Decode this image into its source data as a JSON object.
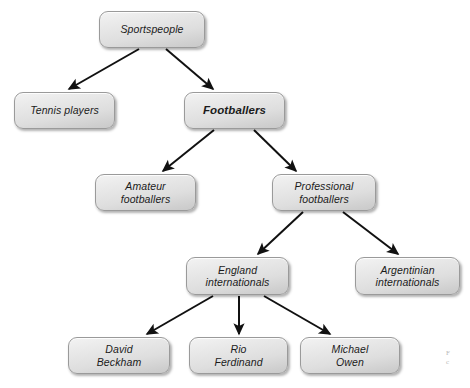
{
  "diagram": {
    "type": "hierarchy-tree",
    "background_color": "#ffffff",
    "node_fill_top": "#f3f3f3",
    "node_fill_bottom": "#c9c9c9",
    "node_border_color": "#9a9a9a",
    "edge_color": "#111111",
    "nodes": [
      {
        "id": "sportspeople",
        "label": "Sportspeople",
        "level": 0,
        "emphasis": false,
        "x": 99,
        "y": 11,
        "w": 106,
        "h": 37
      },
      {
        "id": "tennis-players",
        "label": "Tennis players",
        "level": 1,
        "emphasis": false,
        "x": 14,
        "y": 92,
        "w": 101,
        "h": 37
      },
      {
        "id": "footballers",
        "label": "Footballers",
        "level": 1,
        "emphasis": true,
        "x": 184,
        "y": 92,
        "w": 101,
        "h": 37
      },
      {
        "id": "amateur-footballers",
        "label": "Amateur\nfootballers",
        "level": 2,
        "emphasis": false,
        "x": 95,
        "y": 174,
        "w": 101,
        "h": 37
      },
      {
        "id": "professional-footballers",
        "label": "Professional\nfootballers",
        "level": 2,
        "emphasis": false,
        "x": 272,
        "y": 174,
        "w": 104,
        "h": 37
      },
      {
        "id": "england-internationals",
        "label": "England\ninternationals",
        "level": 3,
        "emphasis": false,
        "x": 186,
        "y": 257,
        "w": 103,
        "h": 38
      },
      {
        "id": "argentinian-internationals",
        "label": "Argentinian\ninternationals",
        "level": 3,
        "emphasis": false,
        "x": 355,
        "y": 257,
        "w": 105,
        "h": 38
      },
      {
        "id": "david-beckham",
        "label": "David\nBeckham",
        "level": 4,
        "emphasis": false,
        "x": 68,
        "y": 337,
        "w": 102,
        "h": 37
      },
      {
        "id": "rio-ferdinand",
        "label": "Rio\nFerdinand",
        "level": 4,
        "emphasis": false,
        "x": 189,
        "y": 337,
        "w": 99,
        "h": 37
      },
      {
        "id": "michael-owen",
        "label": "Michael\nOwen",
        "level": 4,
        "emphasis": false,
        "x": 300,
        "y": 337,
        "w": 100,
        "h": 37
      }
    ],
    "edges": [
      {
        "from": "sportspeople",
        "to": "tennis-players",
        "x1": 139,
        "y1": 49,
        "x2": 69,
        "y2": 89
      },
      {
        "from": "sportspeople",
        "to": "footballers",
        "x1": 166,
        "y1": 49,
        "x2": 213,
        "y2": 89
      },
      {
        "from": "footballers",
        "to": "amateur-footballers",
        "x1": 214,
        "y1": 130,
        "x2": 163,
        "y2": 171
      },
      {
        "from": "footballers",
        "to": "professional-footballers",
        "x1": 254,
        "y1": 130,
        "x2": 296,
        "y2": 171
      },
      {
        "from": "professional-footballers",
        "to": "england-internationals",
        "x1": 303,
        "y1": 212,
        "x2": 258,
        "y2": 254
      },
      {
        "from": "professional-footballers",
        "to": "argentinian-internationals",
        "x1": 343,
        "y1": 212,
        "x2": 398,
        "y2": 254
      },
      {
        "from": "england-internationals",
        "to": "david-beckham",
        "x1": 213,
        "y1": 296,
        "x2": 147,
        "y2": 334
      },
      {
        "from": "england-internationals",
        "to": "rio-ferdinand",
        "x1": 239,
        "y1": 296,
        "x2": 239,
        "y2": 334
      },
      {
        "from": "england-internationals",
        "to": "michael-owen",
        "x1": 264,
        "y1": 296,
        "x2": 330,
        "y2": 334
      }
    ]
  },
  "caption": {
    "text": "F\nc",
    "x": 446,
    "y": 349
  }
}
